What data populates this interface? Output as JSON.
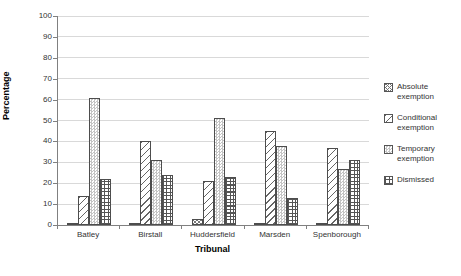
{
  "chart_data": {
    "type": "bar",
    "title": "",
    "xlabel": "Tribunal",
    "ylabel": "Percentage",
    "ylim": [
      0,
      100
    ],
    "ytick_step": 10,
    "grid": "horizontal",
    "legend_position": "right",
    "categories": [
      "Batley",
      "Birstall",
      "Huddersfield",
      "Marsden",
      "Spenborough"
    ],
    "series": [
      {
        "name": "Absolute exemption",
        "pattern": "abs",
        "values": [
          1,
          1,
          3,
          0.5,
          0.5
        ]
      },
      {
        "name": "Conditional exemption",
        "pattern": "cond",
        "values": [
          14,
          40,
          21,
          45,
          37
        ]
      },
      {
        "name": "Temporary exemption",
        "pattern": "temp",
        "values": [
          61,
          31,
          51,
          38,
          27
        ]
      },
      {
        "name": "Dismissed",
        "pattern": "dism",
        "values": [
          22,
          24,
          23,
          13,
          31
        ]
      }
    ],
    "colors": {
      "gridline": "#d9d9d9",
      "axis": "#808080",
      "bar_border": "#4d4d4d",
      "text": "#333333",
      "background": "#ffffff"
    }
  }
}
